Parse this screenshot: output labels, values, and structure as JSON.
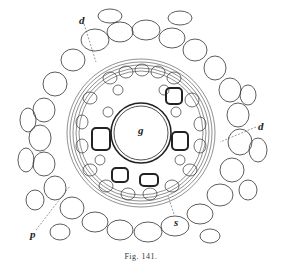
{
  "figure": {
    "caption": "Fig. 141.",
    "labels": [
      {
        "text": "d",
        "x": 79,
        "y": 14
      },
      {
        "text": "d",
        "x": 258,
        "y": 120
      },
      {
        "text": "g",
        "x": 138,
        "y": 124
      },
      {
        "text": "p",
        "x": 30,
        "y": 228
      },
      {
        "text": "s",
        "x": 174,
        "y": 216
      }
    ],
    "colors": {
      "ink": "#2a2a2a",
      "paper": "#ffffff"
    }
  }
}
